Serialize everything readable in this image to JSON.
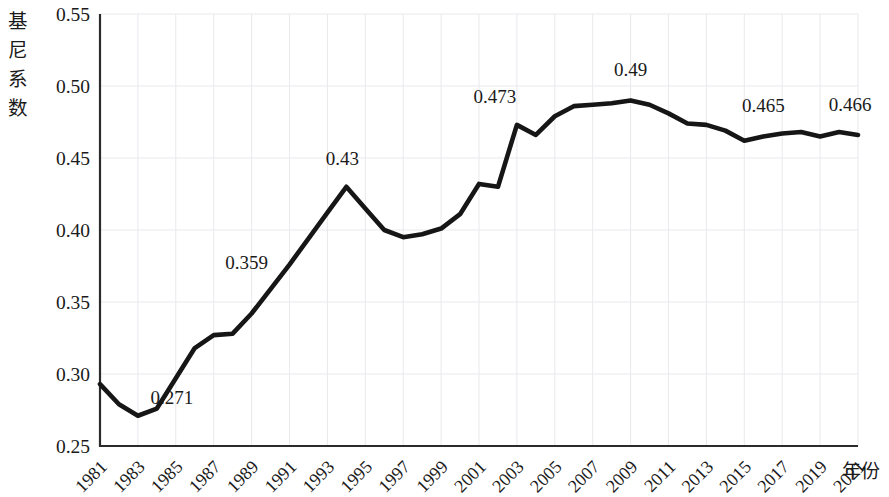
{
  "chart_data": {
    "type": "line",
    "title": "",
    "xlabel": "年份",
    "ylabel": "基尼系数",
    "ylabel_chars": [
      "基",
      "尼",
      "系",
      "数"
    ],
    "ylim": [
      0.25,
      0.55
    ],
    "xlim": [
      1981,
      2021
    ],
    "ytick_labels": [
      "0.55",
      "0.50",
      "0.45",
      "0.40",
      "0.35",
      "0.30",
      "0.25"
    ],
    "ytick_values": [
      0.55,
      0.5,
      0.45,
      0.4,
      0.35,
      0.3,
      0.25
    ],
    "xtick_labels": [
      "1981",
      "1983",
      "1985",
      "1987",
      "1989",
      "1991",
      "1993",
      "1995",
      "1997",
      "1999",
      "2001",
      "2003",
      "2005",
      "2007",
      "2009",
      "2011",
      "2013",
      "2015",
      "2017",
      "2019",
      "2021"
    ],
    "xtick_values": [
      1981,
      1983,
      1985,
      1987,
      1989,
      1991,
      1993,
      1995,
      1997,
      1999,
      2001,
      2003,
      2005,
      2007,
      2009,
      2011,
      2013,
      2015,
      2017,
      2019,
      2021
    ],
    "grid": "light-vertical-and-horizontal",
    "legend": "none",
    "line_color": "#161616",
    "x": [
      1981,
      1982,
      1983,
      1984,
      1985,
      1986,
      1987,
      1988,
      1989,
      1990,
      1991,
      1992,
      1993,
      1994,
      1995,
      1996,
      1997,
      1998,
      1999,
      2000,
      2001,
      2002,
      2003,
      2004,
      2005,
      2006,
      2007,
      2008,
      2009,
      2010,
      2011,
      2012,
      2013,
      2014,
      2015,
      2016,
      2017,
      2018,
      2019,
      2020,
      2021
    ],
    "values": [
      0.293,
      0.279,
      0.271,
      0.276,
      0.297,
      0.318,
      0.327,
      0.328,
      0.342,
      0.359,
      0.376,
      0.394,
      0.412,
      0.43,
      0.415,
      0.4,
      0.395,
      0.397,
      0.401,
      0.411,
      0.432,
      0.43,
      0.473,
      0.466,
      0.479,
      0.486,
      0.487,
      0.488,
      0.49,
      0.487,
      0.481,
      0.474,
      0.473,
      0.469,
      0.462,
      0.465,
      0.467,
      0.468,
      0.465,
      0.468,
      0.466
    ],
    "annotations": [
      {
        "label": "0.271",
        "x": 1983,
        "y": 0.271
      },
      {
        "label": "0.359",
        "x": 1990,
        "y": 0.359
      },
      {
        "label": "0.43",
        "x": 1994,
        "y": 0.43
      },
      {
        "label": "0.473",
        "x": 2003,
        "y": 0.473
      },
      {
        "label": "0.49",
        "x": 2009,
        "y": 0.49
      },
      {
        "label": "0.465",
        "x": 2016,
        "y": 0.465
      },
      {
        "label": "0.466",
        "x": 2021,
        "y": 0.466
      }
    ]
  }
}
